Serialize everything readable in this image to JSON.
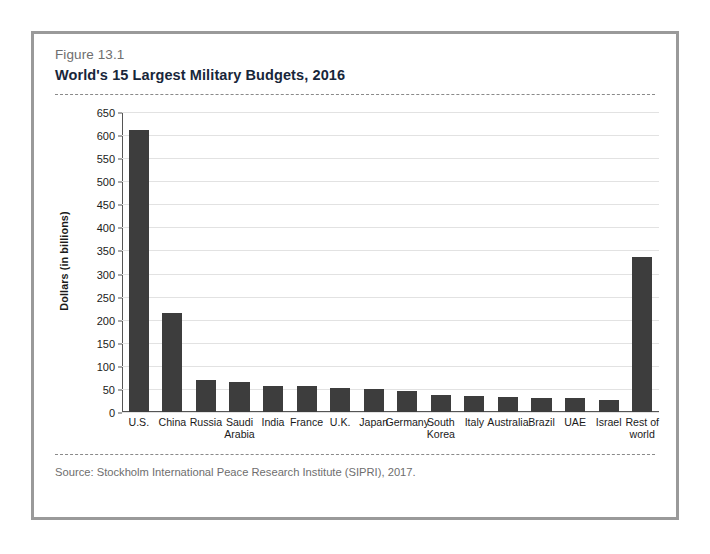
{
  "figure": {
    "number": "Figure 13.1",
    "title": "World's 15 Largest Military Budgets, 2016",
    "source": "Source:  Stockholm International Peace Research Institute (SIPRI), 2017."
  },
  "colors": {
    "bar": "#3d3d3d",
    "frame": "#9a9a9a",
    "gridline": "#e2e2e2",
    "axis": "#555555",
    "title_text": "#18263a",
    "muted_text": "#6e6e6e"
  },
  "chart_data": {
    "type": "bar",
    "title": "World's 15 Largest Military Budgets, 2016",
    "xlabel": "",
    "ylabel": "Dollars (in billions)",
    "ylim": [
      0,
      650
    ],
    "ytick_step": 50,
    "yticks": [
      0,
      50,
      100,
      150,
      200,
      250,
      300,
      350,
      400,
      450,
      500,
      550,
      600,
      650
    ],
    "ytick_labels": [
      "0",
      "50",
      "100",
      "150",
      "200",
      "250",
      "300",
      "350",
      "400",
      "450",
      "500",
      "550",
      "600",
      "650"
    ],
    "grid": true,
    "legend": false,
    "categories": [
      "U.S.",
      "China",
      "Russia",
      "Saudi\nArabia",
      "India",
      "France",
      "U.K.",
      "Japan",
      "Germany",
      "South\nKorea",
      "Italy",
      "Australia",
      "Brazil",
      "UAE",
      "Israel",
      "Rest of\nworld"
    ],
    "values": [
      611,
      215,
      69,
      64,
      56,
      57,
      52,
      50,
      46,
      37,
      35,
      32,
      31,
      31,
      26,
      335
    ]
  }
}
